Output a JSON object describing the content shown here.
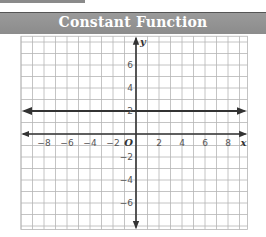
{
  "header": {
    "title": "Constant Function"
  },
  "chart_data": {
    "type": "line",
    "title": "Constant Function",
    "xlabel": "x",
    "ylabel": "y",
    "origin_label": "O",
    "xlim": [
      -10,
      9.7
    ],
    "ylim": [
      -8.3,
      8.5
    ],
    "grid": true,
    "x_ticks": [
      -8,
      -6,
      -4,
      -2,
      2,
      4,
      6,
      8
    ],
    "x_tick_labels": [
      "−8",
      "−6",
      "−4",
      "−2",
      "2",
      "4",
      "6",
      "8"
    ],
    "y_ticks": [
      6,
      4,
      2,
      -2,
      -4,
      -6
    ],
    "y_tick_labels": [
      "6",
      "4",
      "2",
      "−2",
      "−4",
      "−6"
    ],
    "series": [
      {
        "name": "y = 2",
        "equation": "y = 2",
        "x": [
          -10,
          9.7
        ],
        "values": [
          2,
          2
        ],
        "arrows": "both"
      }
    ]
  }
}
